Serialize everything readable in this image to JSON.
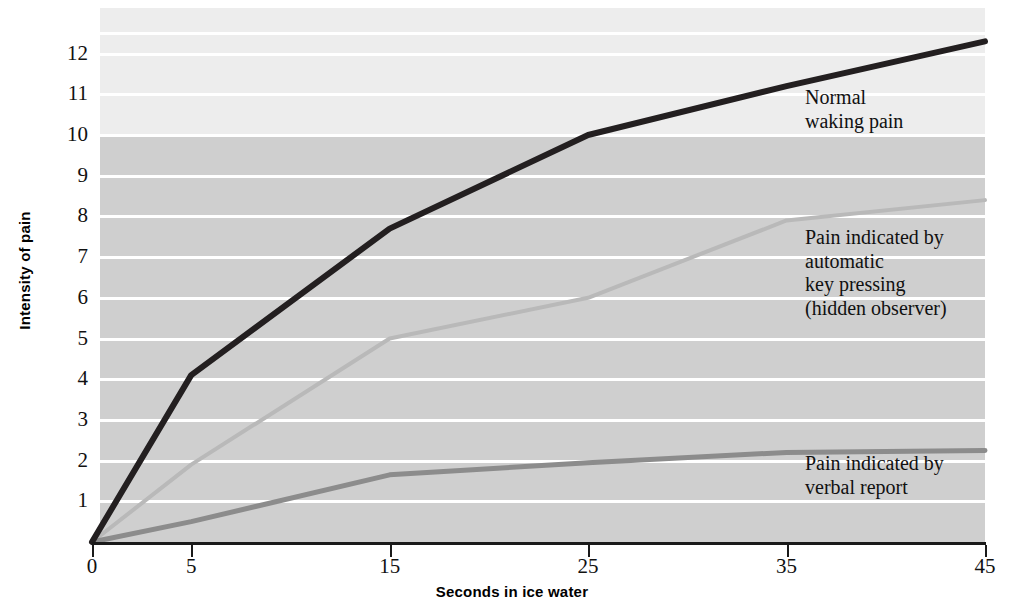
{
  "chart_data": {
    "type": "line",
    "title": "",
    "xlabel": "Seconds in ice water",
    "ylabel": "Intensity of pain",
    "x": [
      0,
      5,
      15,
      25,
      35,
      45
    ],
    "xticks": [
      "0",
      "5",
      "15",
      "25",
      "35",
      "45"
    ],
    "yticks": [
      "1",
      "2",
      "3",
      "4",
      "5",
      "6",
      "7",
      "8",
      "9",
      "10",
      "11",
      "12"
    ],
    "xlim": [
      0,
      45
    ],
    "ylim": [
      0,
      12.8
    ],
    "grid": "horizontal white gridlines at each integer",
    "legend_position": "inline annotations at right of each line",
    "series": [
      {
        "name": "Normal waking pain",
        "label": "Normal\nwaking pain",
        "color": "#231f20",
        "width": 6,
        "values": [
          0,
          4.1,
          7.7,
          10.0,
          11.2,
          12.3
        ]
      },
      {
        "name": "Pain indicated by automatic key pressing (hidden observer)",
        "label": "Pain indicated by\nautomatic\nkey pressing\n(hidden observer)",
        "color": "#b9b9b9",
        "width": 4,
        "values": [
          0,
          1.9,
          5.0,
          6.0,
          7.9,
          8.4
        ]
      },
      {
        "name": "Pain indicated by verbal report",
        "label": "Pain indicated by\nverbal report",
        "color": "#8c8c8c",
        "width": 5,
        "values": [
          0,
          0.5,
          1.65,
          1.95,
          2.2,
          2.25
        ]
      }
    ],
    "background": {
      "upper_band_color": "#ededed",
      "lower_band_color": "#cfcfcf",
      "band_split_value": 10,
      "gridline_color": "#ffffff"
    }
  },
  "annotations": {
    "normal_waking": "Normal\nwaking pain",
    "hidden_observer": "Pain indicated by\nautomatic\nkey pressing\n(hidden observer)",
    "verbal_report": "Pain indicated by\nverbal report"
  },
  "axes": {
    "x_title": "Seconds in ice water",
    "y_title": "Intensity of pain"
  }
}
